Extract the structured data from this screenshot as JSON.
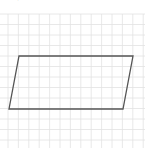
{
  "diagram": {
    "type": "grid-with-parallelogram",
    "background_color": "#ffffff",
    "grid": {
      "color": "#e2e2e2",
      "origin_x": 8,
      "origin_y": 14,
      "spacing_x": 10.4,
      "spacing_y": 10.5,
      "top": 14,
      "bottom": 148,
      "left": 0,
      "right": 145
    },
    "shape": {
      "name": "parallelogram",
      "stroke_color": "#555555",
      "stroke_width": 1.3,
      "vertices": [
        [
          19,
          56
        ],
        [
          133,
          56
        ],
        [
          123,
          109
        ],
        [
          9,
          109
        ]
      ]
    },
    "top_mark": "˙"
  }
}
